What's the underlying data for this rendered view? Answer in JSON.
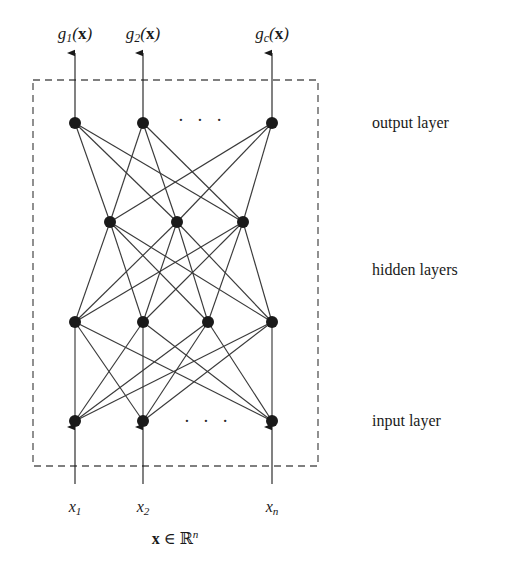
{
  "figure": {
    "type": "neural-network-diagram",
    "background_color": "#ffffff",
    "ink_color": "#1a1a1a",
    "edge_color": "#3a3a3a",
    "dashed_box": {
      "x": 33,
      "y": 80,
      "width": 285,
      "height": 386
    }
  },
  "outputs": {
    "ellipsis": "· · ·",
    "labels": [
      {
        "id": "g1",
        "text_html": "g<sub>1</sub>(<b>x</b>)",
        "x": 75,
        "y": 35
      },
      {
        "id": "g2",
        "text_html": "g<sub>2</sub>(<b>x</b>)",
        "x": 143,
        "y": 35
      },
      {
        "id": "gc",
        "text_html": "g<sub>c</sub>(<b>x</b>)",
        "x": 272,
        "y": 35
      }
    ]
  },
  "inputs": {
    "ellipsis": "· · ·",
    "labels": [
      {
        "id": "x1",
        "text_html": "x<sub>1</sub>",
        "x": 75,
        "y": 508
      },
      {
        "id": "x2",
        "text_html": "x<sub>2</sub>",
        "x": 143,
        "y": 508
      },
      {
        "id": "xn",
        "text_html": "x<sub>n</sub>",
        "x": 272,
        "y": 508
      }
    ],
    "vector_label": {
      "text_html": "<b>x</b> ∈ ℝ<sup>n</sup>",
      "x": 175,
      "y": 538
    }
  },
  "layer_labels": [
    {
      "id": "output-layer",
      "label": "output layer",
      "x": 372,
      "y": 123
    },
    {
      "id": "hidden-layers",
      "label": "hidden layers",
      "x": 372,
      "y": 270
    },
    {
      "id": "input-layer",
      "label": "input layer",
      "x": 372,
      "y": 421
    }
  ],
  "network": {
    "node_radius": 6,
    "layers": [
      {
        "id": "output-layer",
        "name": "output layer",
        "y": 123,
        "node_x": [
          75,
          143,
          272
        ],
        "ellipsis": {
          "x": 202,
          "y": 120
        }
      },
      {
        "id": "hidden-layer-1",
        "name": "hidden layer 1",
        "y": 222,
        "node_x": [
          110,
          177,
          243
        ],
        "ellipsis": null
      },
      {
        "id": "hidden-layer-2",
        "name": "hidden layer 2",
        "y": 322,
        "node_x": [
          75,
          143,
          208,
          272
        ],
        "ellipsis": null
      },
      {
        "id": "input-layer",
        "name": "input layer",
        "y": 421,
        "node_x": [
          75,
          143,
          272
        ],
        "ellipsis": {
          "x": 208,
          "y": 421
        }
      }
    ],
    "connections": [
      {
        "from": "output-layer",
        "to": "hidden-layer-1",
        "fully_connected": true
      },
      {
        "from": "hidden-layer-1",
        "to": "hidden-layer-2",
        "fully_connected": true
      },
      {
        "from": "hidden-layer-2",
        "to": "input-layer",
        "fully_connected": true
      }
    ],
    "output_arrows": {
      "from_y": 123,
      "to_y": 53,
      "direction": "up"
    },
    "input_arrows": {
      "from_y": 484,
      "to_y": 427,
      "direction": "up"
    }
  }
}
